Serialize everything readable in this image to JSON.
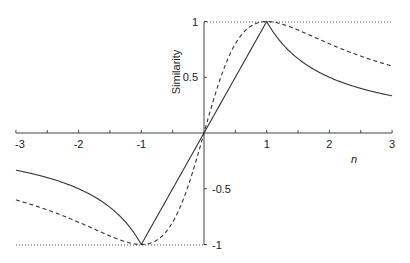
{
  "chart_data": {
    "type": "line",
    "title": "",
    "xlabel": "n",
    "ylabel": "Similarity",
    "xlim": [
      -3,
      3
    ],
    "ylim": [
      -1,
      1
    ],
    "x_ticks": [
      -3,
      -2,
      -1,
      1,
      2,
      3
    ],
    "x_tick_labels": [
      "-3",
      "-2",
      "-1",
      "1",
      "2",
      "3"
    ],
    "y_ticks": [
      1,
      0.5,
      -0.5,
      -1
    ],
    "y_tick_labels": [
      "1",
      "0.5",
      "-0.5",
      "-1"
    ],
    "grid": false,
    "reference_lines": [
      {
        "y": 1,
        "style": "dotted"
      },
      {
        "y": -1,
        "style": "dotted"
      }
    ],
    "series": [
      {
        "name": "solid",
        "style": "solid",
        "description": "linear for |n|<=1, 1/n for |n|>1",
        "x": [
          -3,
          -2.5,
          -2,
          -1.5,
          -1,
          -0.5,
          0,
          0.5,
          1,
          1.5,
          2,
          2.5,
          3
        ],
        "values": [
          -0.33,
          -0.4,
          -0.5,
          -0.67,
          -1,
          -0.5,
          0,
          0.5,
          1,
          0.67,
          0.5,
          0.4,
          0.33
        ]
      },
      {
        "name": "dashed",
        "style": "dashed",
        "description": "2n/(1+n^2)",
        "x": [
          -3,
          -2.5,
          -2,
          -1.5,
          -1,
          -0.5,
          0,
          0.5,
          1,
          1.5,
          2,
          2.5,
          3
        ],
        "values": [
          -0.6,
          -0.69,
          -0.8,
          -0.92,
          -1,
          -0.8,
          0,
          0.8,
          1,
          0.92,
          0.8,
          0.69,
          0.6
        ]
      }
    ]
  },
  "labels": {
    "xlabel": "n",
    "ylabel": "Similarity",
    "x_ticks": [
      "-3",
      "-2",
      "-1",
      "1",
      "2",
      "3"
    ],
    "y_ticks": [
      "1",
      "0.5",
      "-0.5",
      "-1"
    ]
  }
}
